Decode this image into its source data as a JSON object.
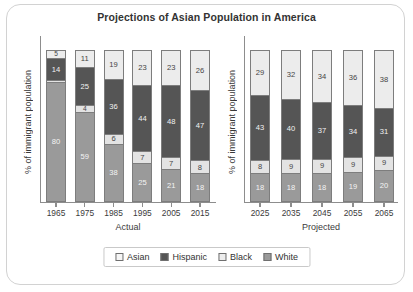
{
  "chart_data": {
    "type": "bar",
    "subtype": "stacked-percentage",
    "title": "Projections of Asian Population in America",
    "xlabel": "",
    "ylabel": "% of immigrant population",
    "ylim": [
      0,
      100
    ],
    "grid": false,
    "legend_position": "bottom-center",
    "legend": [
      "Asian",
      "Hispanic",
      "Black",
      "White"
    ],
    "colors": {
      "Asian": "#ececec",
      "Hispanic": "#555555",
      "Black": "#e3e3e3",
      "White": "#9a9a9a",
      "axis": "#8d8d8d",
      "border": "#d2d2d2",
      "title_text": "#333333"
    },
    "panels": [
      {
        "name": "Actual",
        "group_label": "Actual",
        "ylabel": "% of immigrant population",
        "categories": [
          "1965",
          "1975",
          "1985",
          "1995",
          "2005",
          "2015"
        ],
        "series": [
          {
            "name": "Asian",
            "values": [
              5,
              11,
              19,
              23,
              23,
              26
            ]
          },
          {
            "name": "Hispanic",
            "values": [
              14,
              25,
              36,
              44,
              48,
              47
            ]
          },
          {
            "name": "Black",
            "values": [
              1,
              4,
              6,
              7,
              7,
              8
            ]
          },
          {
            "name": "White",
            "values": [
              80,
              59,
              38,
              25,
              21,
              18
            ]
          }
        ]
      },
      {
        "name": "Projected",
        "group_label": "Projected",
        "ylabel": "% of immigrant population",
        "categories": [
          "2025",
          "2035",
          "2045",
          "2055",
          "2065"
        ],
        "series": [
          {
            "name": "Asian",
            "values": [
              29,
              32,
              34,
              36,
              38
            ]
          },
          {
            "name": "Hispanic",
            "values": [
              43,
              40,
              37,
              34,
              31
            ]
          },
          {
            "name": "Black",
            "values": [
              8,
              9,
              9,
              9,
              9
            ]
          },
          {
            "name": "White",
            "values": [
              18,
              18,
              18,
              19,
              20
            ]
          }
        ]
      }
    ]
  }
}
